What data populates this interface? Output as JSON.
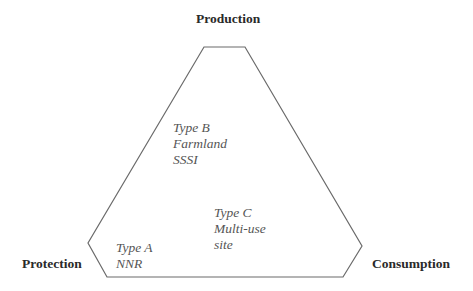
{
  "diagram": {
    "title": "",
    "shape": "truncated-triangle (hexagon)",
    "stroke_color": "#6a6a6a",
    "vertices": [
      [
        204,
        47
      ],
      [
        245,
        47
      ],
      [
        362,
        246
      ],
      [
        343,
        277
      ],
      [
        107,
        277
      ],
      [
        88,
        243
      ]
    ],
    "corners": {
      "top": "Production",
      "left": "Protection",
      "right": "Consumption"
    },
    "regions": [
      {
        "id": "type-b",
        "lines": [
          "Type B",
          "Farmland",
          "SSSI"
        ]
      },
      {
        "id": "type-c",
        "lines": [
          "Type C",
          "Multi-use",
          "site"
        ]
      },
      {
        "id": "type-a",
        "lines": [
          "Type A",
          "NNR"
        ]
      }
    ]
  }
}
